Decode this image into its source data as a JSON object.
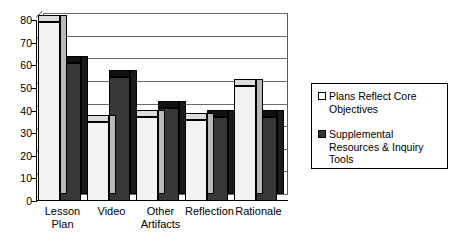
{
  "chart_data": {
    "type": "bar",
    "title": "",
    "xlabel": "",
    "ylabel": "",
    "ylim": [
      0,
      80
    ],
    "yticks": [
      0,
      10,
      20,
      30,
      40,
      50,
      60,
      70,
      80
    ],
    "grid": true,
    "legend_position": "right",
    "categories": [
      "Lesson\nPlan",
      "Video",
      "Other\nArtifacts",
      "Reflection",
      "Rationale"
    ],
    "series": [
      {
        "name": "Plans Reflect Core Objectives",
        "color": "#f2f2f2",
        "values": [
          79,
          35,
          37,
          36,
          51
        ]
      },
      {
        "name": "Supplemental Resources & Inquiry Tools",
        "color": "#373737",
        "values": [
          61,
          55,
          41,
          37,
          37
        ]
      }
    ]
  },
  "legend": {
    "entries": [
      {
        "marker": "open-square-swatch",
        "label": "Plans Reflect Core Objectives"
      },
      {
        "marker": "filled-square-swatch",
        "label": "Supplemental Resources & Inquiry Tools"
      }
    ]
  }
}
